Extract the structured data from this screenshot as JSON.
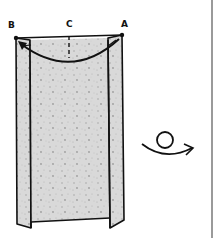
{
  "diagram": {
    "type": "origami-step",
    "points": [
      {
        "id": "B",
        "label": "B"
      },
      {
        "id": "C",
        "label": "C"
      },
      {
        "id": "A",
        "label": "A"
      }
    ],
    "instructions": {
      "fold_arrow": "fold point A over to point B",
      "crease_mark": "dashed center crease at C",
      "turn_over_symbol": "turn model over"
    },
    "colors": {
      "paper": "#d6d6d6",
      "line": "#111111",
      "border": "#9a9a9a"
    }
  }
}
